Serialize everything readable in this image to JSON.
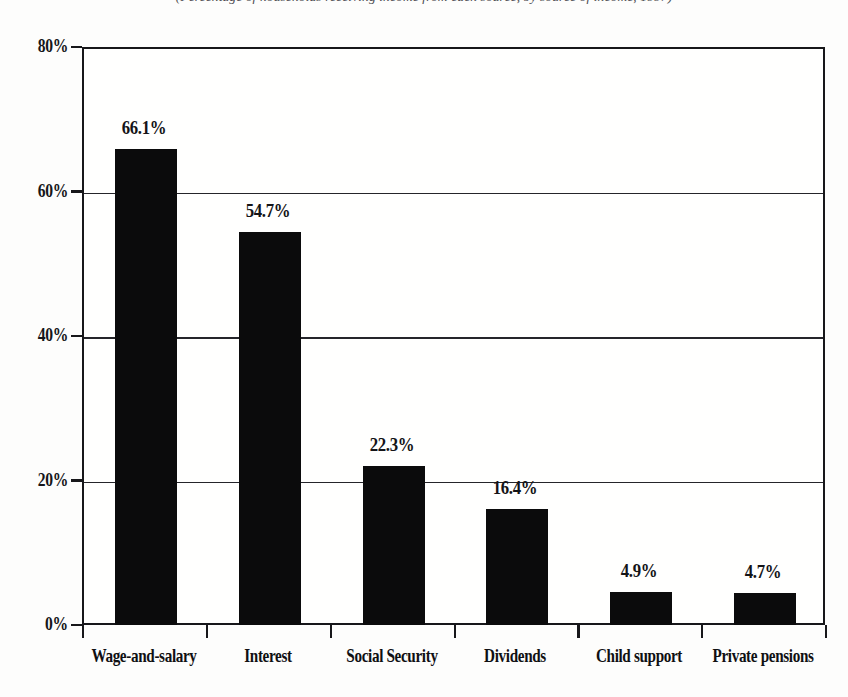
{
  "caption": "(Percentage of households receiving income from each source, by source of income, 1997)",
  "chart_data": {
    "type": "bar",
    "title": "",
    "subtitle": "",
    "xlabel": "",
    "ylabel": "",
    "categories": [
      "Wage-and-salary",
      "Interest",
      "Social Security",
      "Dividends",
      "Child support",
      "Private pensions"
    ],
    "values": [
      66.1,
      54.7,
      22.3,
      16.4,
      4.9,
      4.7
    ],
    "value_labels": [
      "66.1%",
      "54.7%",
      "22.3%",
      "16.4%",
      "4.9%",
      "4.7%"
    ],
    "ylim": [
      0,
      80
    ],
    "yticks": [
      0,
      20,
      40,
      60,
      80
    ],
    "ytick_labels": [
      "0%",
      "20%",
      "40%",
      "60%",
      "80%"
    ],
    "grid": true,
    "legend": "none",
    "bar_color": "#0b0b0c",
    "axis_color": "#17171a",
    "background_color": "#ffffff"
  }
}
